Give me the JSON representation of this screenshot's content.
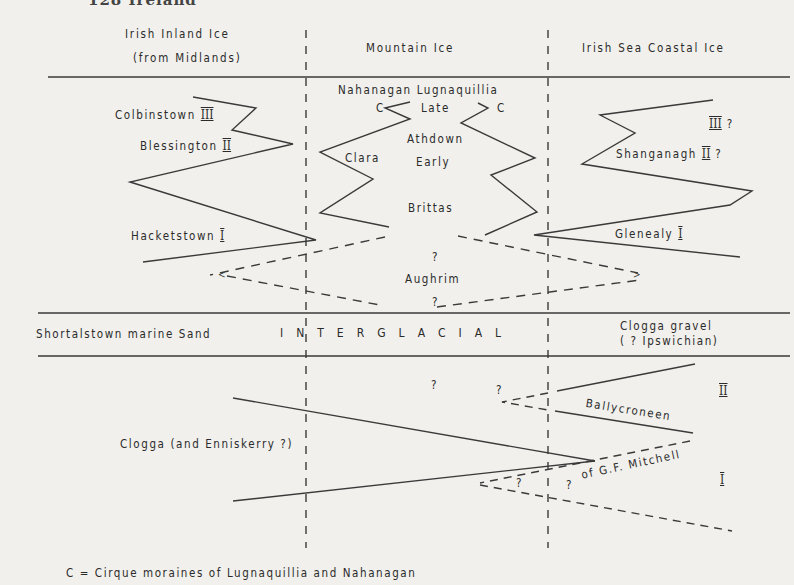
{
  "page_header": "128  Ireland",
  "columns": {
    "inland": [
      "Irish Inland Ice",
      "(from Midlands)"
    ],
    "mountain": "Mountain Ice",
    "coastal": "Irish Sea Coastal Ice"
  },
  "upper": {
    "inland": {
      "colbinstown": "Colbinstown",
      "colbinstown_stage": "III",
      "blessington": "Blessington",
      "blessington_stage": "II",
      "hacketstown": "Hacketstown",
      "hacketstown_stage": "I"
    },
    "mountain": {
      "nahanagan_lugnaquillia": "Nahanagan  Lugnaquillia",
      "c_left": "C",
      "c_right": "C",
      "late": "Late",
      "athdown": "Athdown",
      "early": "Early",
      "clara": "Clara",
      "brittas": "Brittas",
      "q_top": "?",
      "aughrim": "Aughrim",
      "q_bottom": "?"
    },
    "coastal": {
      "stage3": "III ?",
      "stage3_roman": "III",
      "stage3_q": "?",
      "shanganagh": "Shanganagh",
      "shanganagh_stage": "II",
      "shanganagh_q": "?",
      "glenealy": "Glenealy",
      "glenealy_stage": "I"
    }
  },
  "interglacial": {
    "left": "Shortalstown marine Sand",
    "center": "INTERGLACIAL",
    "right": [
      "Clogga gravel",
      "( ? Ipswichian)"
    ]
  },
  "lower": {
    "clogga": "Clogga (and Enniskerry ?)",
    "q1": "?",
    "q2": "?",
    "q3": "?",
    "q4": "?",
    "ballycroneen": "Ballycroneen",
    "mitchell": "of G.F. Mitchell",
    "stage2": "II",
    "stage1": "I"
  },
  "legend": "C = Cirque  moraines  of  Lugnaquillia  and  Nahanagan"
}
